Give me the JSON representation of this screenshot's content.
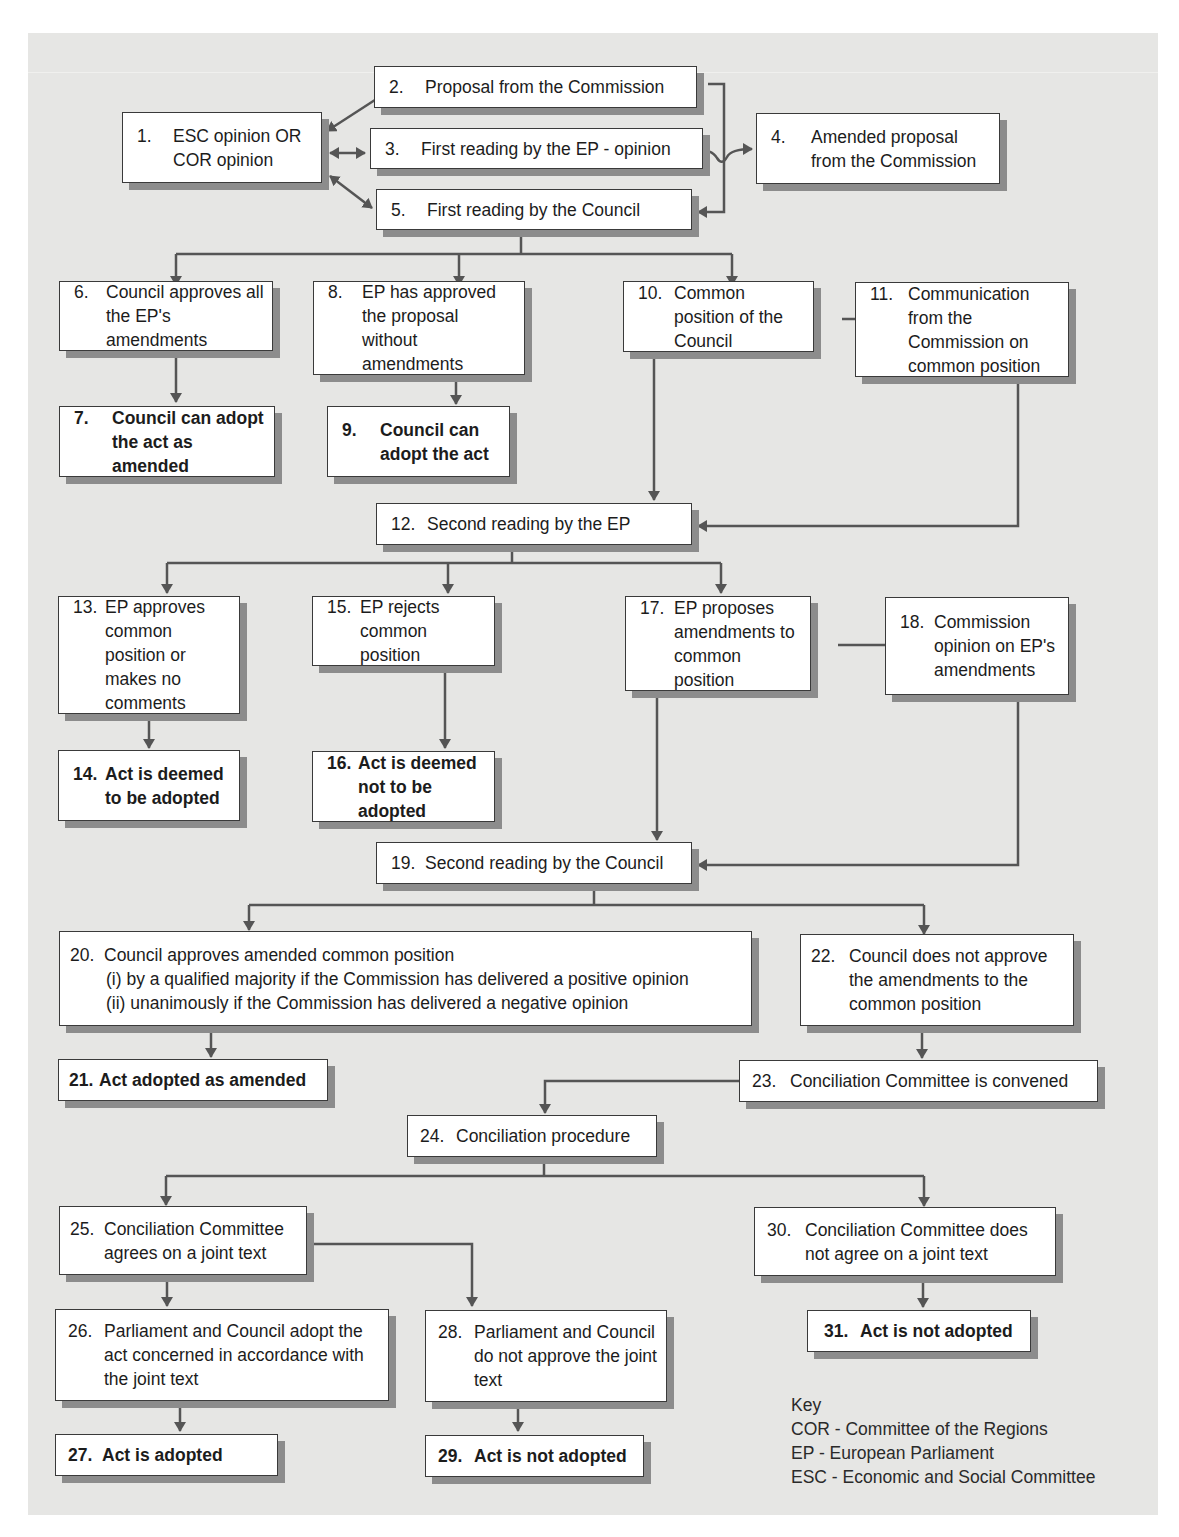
{
  "diagram": {
    "colors": {
      "panel": "#e6e6e4",
      "box": "#ffffff",
      "border": "#3a3a3a",
      "shadow": "#8c8c8c",
      "connector": "#555555"
    },
    "nodes": {
      "n1": {
        "num": "1.",
        "text": "ESC opinion OR COR opinion"
      },
      "n2": {
        "num": "2.",
        "text": "Proposal from the Commission"
      },
      "n3": {
        "num": "3.",
        "text": "First reading by the EP - opinion"
      },
      "n4": {
        "num": "4.",
        "text": "Amended proposal from the Commission"
      },
      "n5": {
        "num": "5.",
        "text": "First reading by the Council"
      },
      "n6": {
        "num": "6.",
        "text": "Council approves all the EP's amendments"
      },
      "n7": {
        "num": "7.",
        "text": "Council can adopt the act as amended"
      },
      "n8": {
        "num": "8.",
        "text": "EP has approved the proposal without amendments"
      },
      "n9": {
        "num": "9.",
        "text": "Council can adopt the act"
      },
      "n10": {
        "num": "10.",
        "text": "Common position of the Council"
      },
      "n11": {
        "num": "11.",
        "text": "Communication from the Commission on common position"
      },
      "n12": {
        "num": "12.",
        "text": "Second reading by the EP"
      },
      "n13": {
        "num": "13.",
        "text": "EP approves common position or makes no comments"
      },
      "n14": {
        "num": "14.",
        "text": "Act is deemed to be adopted"
      },
      "n15": {
        "num": "15.",
        "text": "EP rejects common position"
      },
      "n16": {
        "num": "16.",
        "text": "Act is deemed not to be adopted"
      },
      "n17": {
        "num": "17.",
        "text": "EP proposes amendments to common position"
      },
      "n18": {
        "num": "18.",
        "text": "Commission opinion on EP's amendments"
      },
      "n19": {
        "num": "19.",
        "text": "Second reading by the Council"
      },
      "n20": {
        "num": "20.",
        "text": "Council approves amended common position",
        "line_i": "(i)  by a qualified majority if the Commission has delivered a positive opinion",
        "line_ii": "(ii)  unanimously if the Commission has delivered a negative opinion"
      },
      "n21": {
        "num": "21.",
        "text": "Act adopted as amended"
      },
      "n22": {
        "num": "22.",
        "text": "Council does not approve the amendments to the common position"
      },
      "n23": {
        "num": "23.",
        "text": "Conciliation Committee is convened"
      },
      "n24": {
        "num": "24.",
        "text": "Conciliation procedure"
      },
      "n25": {
        "num": "25.",
        "text": "Conciliation Committee agrees on a joint text"
      },
      "n26": {
        "num": "26.",
        "text": "Parliament and Council adopt the act concerned in accordance with the joint text"
      },
      "n27": {
        "num": "27.",
        "text": "Act is adopted"
      },
      "n28": {
        "num": "28.",
        "text": "Parliament and Council do not approve the joint text"
      },
      "n29": {
        "num": "29.",
        "text": "Act is not adopted"
      },
      "n30": {
        "num": "30.",
        "text": "Conciliation Committee does not agree on a joint text"
      },
      "n31": {
        "num": "31.",
        "text": "Act is not adopted"
      }
    },
    "key": {
      "title": "Key",
      "entries": [
        "COR - Committee of the Regions",
        "EP - European Parliament",
        "ESC - Economic and Social Committee"
      ]
    }
  }
}
